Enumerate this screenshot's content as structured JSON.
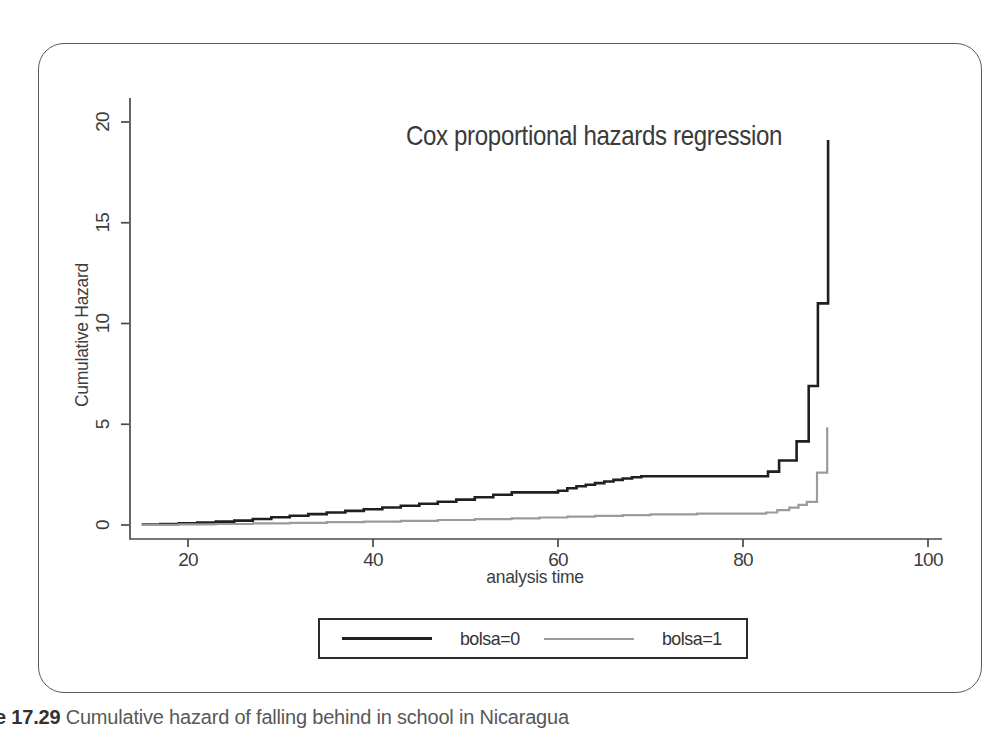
{
  "chart_data": {
    "type": "line",
    "subtype": "step-after",
    "title": "Cox proportional hazards regression",
    "xlabel": "analysis time",
    "ylabel": "Cumulative Hazard",
    "xticks": [
      20,
      40,
      60,
      80,
      100
    ],
    "yticks": [
      0,
      5,
      10,
      15,
      20
    ],
    "xlim": [
      13.7,
      103.3
    ],
    "ylim": [
      0,
      21
    ],
    "grid": false,
    "legend_position": "below-plot-boxed",
    "series": [
      {
        "name": "bolsa=0",
        "color": "#1f1f1f",
        "line_width": 2.6,
        "points": [
          [
            15,
            0.02
          ],
          [
            17,
            0.05
          ],
          [
            19,
            0.08
          ],
          [
            21,
            0.12
          ],
          [
            23,
            0.17
          ],
          [
            25,
            0.22
          ],
          [
            27,
            0.3
          ],
          [
            29,
            0.38
          ],
          [
            31,
            0.46
          ],
          [
            33,
            0.54
          ],
          [
            35,
            0.62
          ],
          [
            37,
            0.7
          ],
          [
            39,
            0.78
          ],
          [
            41,
            0.87
          ],
          [
            43,
            0.96
          ],
          [
            45,
            1.05
          ],
          [
            47,
            1.15
          ],
          [
            49,
            1.26
          ],
          [
            51,
            1.38
          ],
          [
            53,
            1.5
          ],
          [
            55,
            1.62
          ],
          [
            60,
            1.7
          ],
          [
            61,
            1.82
          ],
          [
            62,
            1.92
          ],
          [
            63,
            2.0
          ],
          [
            64,
            2.08
          ],
          [
            65,
            2.16
          ],
          [
            66,
            2.24
          ],
          [
            67,
            2.31
          ],
          [
            68,
            2.37
          ],
          [
            69,
            2.42
          ],
          [
            82.7,
            2.65
          ],
          [
            83.9,
            3.2
          ],
          [
            85.8,
            4.15
          ],
          [
            87.1,
            6.9
          ],
          [
            88.1,
            11.0
          ],
          [
            89.2,
            19.1
          ]
        ]
      },
      {
        "name": "bolsa=1",
        "color": "#9b9b9b",
        "line_width": 2.2,
        "points": [
          [
            15,
            0.01
          ],
          [
            19,
            0.03
          ],
          [
            23,
            0.05
          ],
          [
            27,
            0.08
          ],
          [
            31,
            0.11
          ],
          [
            35,
            0.14
          ],
          [
            39,
            0.17
          ],
          [
            43,
            0.21
          ],
          [
            47,
            0.25
          ],
          [
            51,
            0.29
          ],
          [
            55,
            0.33
          ],
          [
            58,
            0.37
          ],
          [
            61,
            0.41
          ],
          [
            64,
            0.45
          ],
          [
            67,
            0.49
          ],
          [
            70,
            0.53
          ],
          [
            75,
            0.56
          ],
          [
            82.5,
            0.62
          ],
          [
            83.7,
            0.74
          ],
          [
            85,
            0.86
          ],
          [
            86,
            1.0
          ],
          [
            86.9,
            1.15
          ],
          [
            88,
            2.6
          ],
          [
            89.1,
            4.85
          ]
        ]
      }
    ]
  },
  "caption": {
    "prefix": "Figure",
    "number": "17.29",
    "text": "Cumulative hazard of falling behind in school in Nicaragua"
  }
}
